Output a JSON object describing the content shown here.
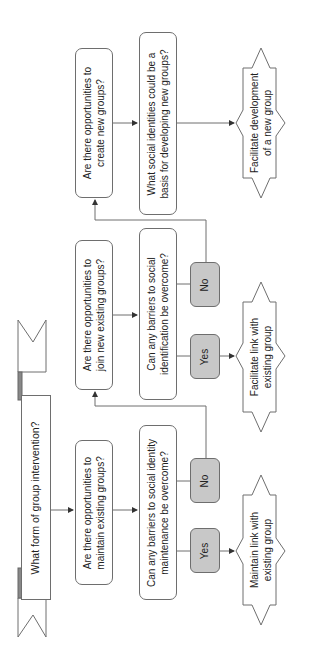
{
  "diagram": {
    "orientation": "rotated 90 degrees counter-clockwise",
    "start": {
      "label": "What form of group intervention?"
    },
    "columns": [
      {
        "question": "Are there opportunities to maintain existing groups?",
        "question_lines": [
          "Are there opportunities to",
          "maintain existing groups?"
        ],
        "followup": "Can any barriers to social identity maintenance be overcome?",
        "followup_lines": [
          "Can any barriers to social identity",
          "maintenance be overcome?"
        ],
        "yes": "Yes",
        "no": "No",
        "outcome_lines": [
          "Maintain link with",
          "existing group"
        ]
      },
      {
        "question": "Are there opportunities to join new existing groups?",
        "question_lines": [
          "Are there opportunities to",
          "join new existing groups?"
        ],
        "followup": "Can any barriers to social identification be overcome?",
        "followup_lines": [
          "Can any barriers to social",
          "identification be overcome?"
        ],
        "yes": "Yes",
        "no": "No",
        "outcome_lines": [
          "Facilitate link with",
          "existing group"
        ]
      },
      {
        "question": "Are there opportunities to create new groups?",
        "question_lines": [
          "Are there opportunities to",
          "create new groups?"
        ],
        "followup": "What social identities could be a basis for developing new groups?",
        "followup_lines": [
          "What social identities could be a",
          "basis for developing new groups?"
        ],
        "outcome_lines": [
          "Facilitate development",
          "of a new group"
        ]
      }
    ],
    "colors": {
      "stroke": "#6e6e6e",
      "decision_fill": "#c8c8c8",
      "box_fill": "#ffffff",
      "text": "#222222"
    }
  }
}
